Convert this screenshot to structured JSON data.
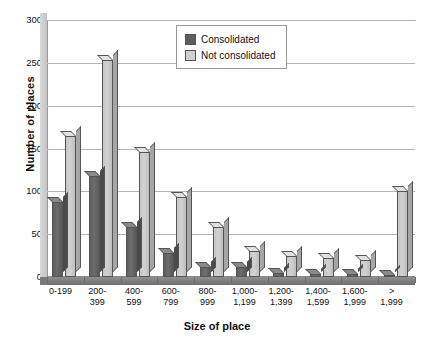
{
  "chart_data": {
    "type": "bar",
    "title": "",
    "xlabel": "Size of place",
    "ylabel": "Number of places",
    "ylim": [
      0,
      300
    ],
    "yticks": [
      0,
      50,
      100,
      150,
      200,
      250,
      300
    ],
    "grid": true,
    "legend_position": "top-center",
    "categories": [
      "0-199",
      "200-399",
      "400-599",
      "600-799",
      "800-999",
      "1,000-1,199",
      "1,200-1,399",
      "1,400-1,599",
      "1,600-1,999",
      "> 1,999"
    ],
    "category_lines": [
      [
        "0-199",
        ""
      ],
      [
        "200-",
        "399"
      ],
      [
        "400-",
        "599"
      ],
      [
        "600-",
        "799"
      ],
      [
        "800-",
        "999"
      ],
      [
        "1,000-",
        "1,199"
      ],
      [
        "1,200-",
        "1,399"
      ],
      [
        "1,400-",
        "1,599"
      ],
      [
        "1,600-",
        "1,999"
      ],
      [
        ">",
        "1,999"
      ]
    ],
    "series": [
      {
        "name": "Consolidated",
        "color": "#5e5e5e",
        "values": [
          88,
          118,
          58,
          28,
          12,
          12,
          5,
          4,
          4,
          2
        ]
      },
      {
        "name": "Not consolidated",
        "color": "#cfcfcf",
        "values": [
          165,
          253,
          146,
          93,
          58,
          30,
          25,
          22,
          20,
          100
        ]
      }
    ]
  },
  "legend": {
    "items": [
      {
        "label": "Consolidated",
        "swatch": "dark-swatch-icon"
      },
      {
        "label": "Not consolidated",
        "swatch": "light-swatch-icon"
      }
    ]
  },
  "axes": {
    "y_title": "Number of places",
    "x_title": "Size of place",
    "y_tick_labels": [
      "300",
      "250",
      "200",
      "150",
      "100",
      "50",
      "0"
    ]
  }
}
